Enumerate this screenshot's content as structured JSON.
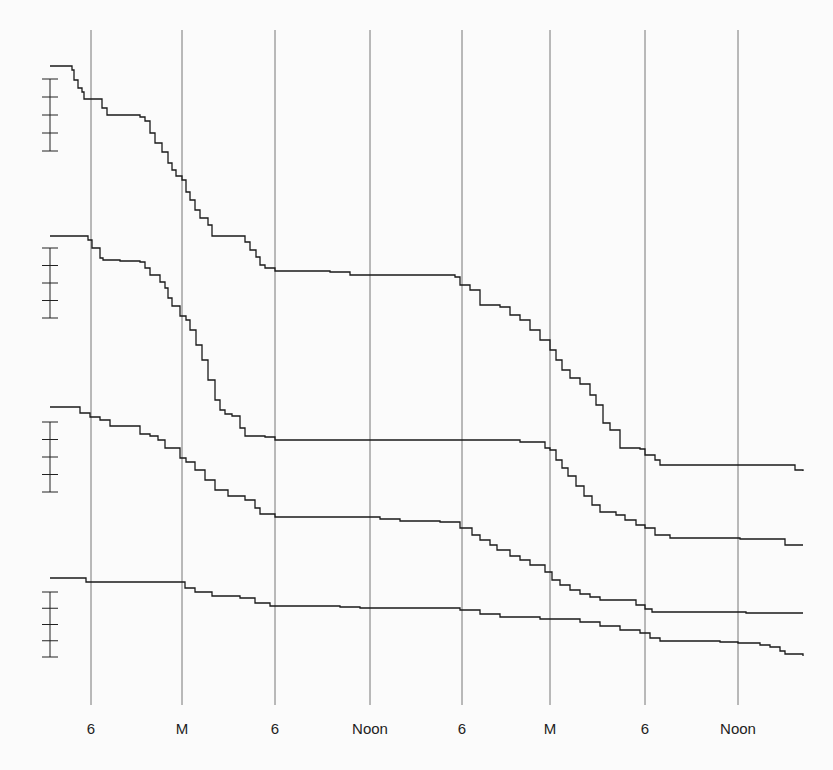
{
  "chart_data": {
    "type": "line",
    "title": "",
    "xlabel": "",
    "ylabel": "",
    "grid": "vertical lines only",
    "legend": "none",
    "step": true,
    "x_ticks": [
      {
        "label": "6",
        "x": 91
      },
      {
        "label": "M",
        "x": 182
      },
      {
        "label": "6",
        "x": 275
      },
      {
        "label": "Noon",
        "x": 370
      },
      {
        "label": "6",
        "x": 462
      },
      {
        "label": "M",
        "x": 550
      },
      {
        "label": "6",
        "x": 645
      },
      {
        "label": "Noon",
        "x": 738
      }
    ],
    "x_range_hours": [
      0,
      48
    ],
    "scale_bars": [
      {
        "series": 1,
        "top": 79,
        "bottom": 151,
        "ticks": 5
      },
      {
        "series": 2,
        "top": 248,
        "bottom": 318,
        "ticks": 5
      },
      {
        "series": 3,
        "top": 422,
        "bottom": 492,
        "ticks": 5
      },
      {
        "series": 4,
        "top": 592,
        "bottom": 657,
        "ticks": 5
      }
    ],
    "series": [
      {
        "name": "Curve 1",
        "description": "Top step curve; steep decline before and around first midnight, plateau through noon, second steep decline around second midnight, flat after second 6 AM",
        "points": [
          [
            50,
            66
          ],
          [
            68,
            66
          ],
          [
            72,
            70
          ],
          [
            74,
            80
          ],
          [
            78,
            88
          ],
          [
            82,
            92
          ],
          [
            84,
            99
          ],
          [
            98,
            99
          ],
          [
            102,
            108
          ],
          [
            107,
            115
          ],
          [
            120,
            115
          ],
          [
            140,
            117
          ],
          [
            145,
            121
          ],
          [
            150,
            133
          ],
          [
            155,
            143
          ],
          [
            162,
            152
          ],
          [
            168,
            163
          ],
          [
            172,
            170
          ],
          [
            176,
            176
          ],
          [
            182,
            180
          ],
          [
            186,
            192
          ],
          [
            190,
            200
          ],
          [
            195,
            210
          ],
          [
            200,
            218
          ],
          [
            208,
            225
          ],
          [
            212,
            236
          ],
          [
            240,
            236
          ],
          [
            245,
            242
          ],
          [
            250,
            250
          ],
          [
            256,
            257
          ],
          [
            260,
            265
          ],
          [
            265,
            268
          ],
          [
            275,
            271
          ],
          [
            330,
            272
          ],
          [
            350,
            275
          ],
          [
            440,
            275
          ],
          [
            455,
            277
          ],
          [
            460,
            285
          ],
          [
            470,
            290
          ],
          [
            480,
            305
          ],
          [
            500,
            307
          ],
          [
            510,
            315
          ],
          [
            520,
            320
          ],
          [
            530,
            330
          ],
          [
            540,
            340
          ],
          [
            550,
            350
          ],
          [
            556,
            360
          ],
          [
            562,
            370
          ],
          [
            570,
            378
          ],
          [
            580,
            384
          ],
          [
            590,
            395
          ],
          [
            596,
            405
          ],
          [
            603,
            423
          ],
          [
            610,
            430
          ],
          [
            620,
            448
          ],
          [
            640,
            449
          ],
          [
            645,
            455
          ],
          [
            655,
            460
          ],
          [
            660,
            465
          ],
          [
            790,
            465
          ],
          [
            795,
            470
          ],
          [
            803,
            471
          ]
        ]
      },
      {
        "name": "Curve 2",
        "description": "Second step curve; plateau until 6 PM, steep drop from midnight to ~3 AM, flat through noon, then decline to second 6 AM and slight decline after",
        "points": [
          [
            50,
            236
          ],
          [
            84,
            236
          ],
          [
            88,
            240
          ],
          [
            92,
            248
          ],
          [
            100,
            258
          ],
          [
            103,
            260
          ],
          [
            120,
            261
          ],
          [
            140,
            262
          ],
          [
            145,
            268
          ],
          [
            150,
            275
          ],
          [
            160,
            282
          ],
          [
            165,
            288
          ],
          [
            168,
            298
          ],
          [
            172,
            306
          ],
          [
            180,
            316
          ],
          [
            186,
            320
          ],
          [
            190,
            330
          ],
          [
            196,
            345
          ],
          [
            202,
            360
          ],
          [
            208,
            380
          ],
          [
            215,
            400
          ],
          [
            220,
            410
          ],
          [
            225,
            414
          ],
          [
            232,
            416
          ],
          [
            240,
            428
          ],
          [
            245,
            436
          ],
          [
            265,
            437
          ],
          [
            275,
            440
          ],
          [
            500,
            440
          ],
          [
            520,
            442
          ],
          [
            545,
            448
          ],
          [
            550,
            450
          ],
          [
            556,
            460
          ],
          [
            562,
            468
          ],
          [
            568,
            476
          ],
          [
            576,
            486
          ],
          [
            584,
            496
          ],
          [
            592,
            505
          ],
          [
            600,
            512
          ],
          [
            616,
            515
          ],
          [
            625,
            520
          ],
          [
            636,
            525
          ],
          [
            645,
            528
          ],
          [
            655,
            535
          ],
          [
            670,
            538
          ],
          [
            740,
            539
          ],
          [
            780,
            539
          ],
          [
            785,
            545
          ],
          [
            803,
            545
          ]
        ]
      },
      {
        "name": "Curve 3",
        "description": "Third step curve; gradual decline from evening to morning, plateau through noon, gradual decline to second 6 AM, flat after",
        "points": [
          [
            50,
            407
          ],
          [
            75,
            407
          ],
          [
            80,
            413
          ],
          [
            90,
            417
          ],
          [
            100,
            420
          ],
          [
            110,
            426
          ],
          [
            135,
            426
          ],
          [
            140,
            434
          ],
          [
            150,
            436
          ],
          [
            158,
            440
          ],
          [
            165,
            448
          ],
          [
            180,
            458
          ],
          [
            186,
            462
          ],
          [
            195,
            470
          ],
          [
            205,
            480
          ],
          [
            215,
            490
          ],
          [
            228,
            496
          ],
          [
            245,
            500
          ],
          [
            255,
            508
          ],
          [
            260,
            514
          ],
          [
            275,
            517
          ],
          [
            380,
            519
          ],
          [
            400,
            521
          ],
          [
            440,
            522
          ],
          [
            460,
            528
          ],
          [
            472,
            535
          ],
          [
            480,
            540
          ],
          [
            490,
            545
          ],
          [
            497,
            550
          ],
          [
            510,
            556
          ],
          [
            520,
            560
          ],
          [
            530,
            565
          ],
          [
            545,
            572
          ],
          [
            552,
            580
          ],
          [
            560,
            585
          ],
          [
            570,
            590
          ],
          [
            580,
            594
          ],
          [
            590,
            597
          ],
          [
            600,
            600
          ],
          [
            620,
            600
          ],
          [
            636,
            605
          ],
          [
            645,
            609
          ],
          [
            652,
            612
          ],
          [
            740,
            612
          ],
          [
            746,
            613
          ],
          [
            803,
            613
          ]
        ]
      },
      {
        "name": "Curve 4",
        "description": "Bottom step curve; nearly flat with gentle stepwise decline throughout; small final drop near end",
        "points": [
          [
            50,
            578
          ],
          [
            83,
            578
          ],
          [
            86,
            582
          ],
          [
            180,
            582
          ],
          [
            185,
            588
          ],
          [
            195,
            592
          ],
          [
            212,
            596
          ],
          [
            240,
            598
          ],
          [
            255,
            603
          ],
          [
            270,
            606
          ],
          [
            340,
            607
          ],
          [
            360,
            608
          ],
          [
            450,
            608
          ],
          [
            460,
            610
          ],
          [
            480,
            614
          ],
          [
            500,
            617
          ],
          [
            540,
            619
          ],
          [
            580,
            622
          ],
          [
            600,
            626
          ],
          [
            620,
            630
          ],
          [
            640,
            633
          ],
          [
            650,
            638
          ],
          [
            660,
            641
          ],
          [
            720,
            642
          ],
          [
            738,
            643
          ],
          [
            760,
            645
          ],
          [
            770,
            647
          ],
          [
            780,
            651
          ],
          [
            785,
            654
          ],
          [
            803,
            656
          ]
        ]
      }
    ]
  }
}
